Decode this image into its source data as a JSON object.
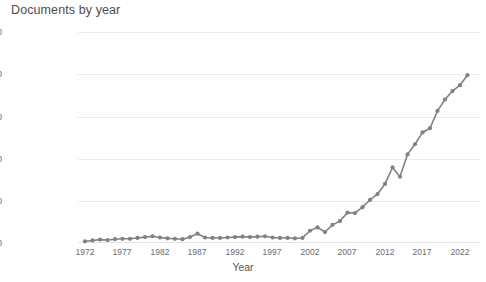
{
  "chart_data": {
    "type": "line",
    "title": "Documents by year",
    "xlabel": "Year",
    "ylabel": "Documents",
    "xlim": [
      1971,
      1024
    ],
    "ylim": [
      0,
      500
    ],
    "grid": true,
    "legend": null,
    "line_color": "#808285",
    "marker_color": "#7f8184",
    "y_ticks": [
      0,
      100,
      200,
      300,
      400,
      500
    ],
    "x_ticks": [
      1972,
      1977,
      1982,
      1987,
      1992,
      1997,
      2002,
      2007,
      2012,
      2017,
      2022
    ],
    "x": [
      1972,
      1973,
      1974,
      1975,
      1976,
      1977,
      1978,
      1979,
      1980,
      1981,
      1982,
      1983,
      1984,
      1985,
      1986,
      1987,
      1988,
      1989,
      1990,
      1991,
      1992,
      1993,
      1994,
      1995,
      1996,
      1997,
      1998,
      1999,
      2000,
      2001,
      2002,
      2003,
      2004,
      2005,
      2006,
      2007,
      2008,
      2009,
      2010,
      2011,
      2012,
      2013,
      2014,
      2015,
      2016,
      2017,
      2018,
      2019,
      2020,
      2021,
      2022,
      2023
    ],
    "values": [
      4,
      6,
      8,
      7,
      9,
      10,
      10,
      12,
      14,
      16,
      13,
      11,
      10,
      9,
      14,
      22,
      13,
      12,
      12,
      13,
      14,
      15,
      14,
      15,
      16,
      13,
      12,
      12,
      11,
      12,
      29,
      37,
      26,
      43,
      52,
      72,
      71,
      85,
      102,
      116,
      140,
      179,
      157,
      210,
      234,
      262,
      272,
      313,
      340,
      360,
      374,
      398
    ],
    "last_point_value": 57,
    "last_point_note": "2023 partial year drop to 57"
  }
}
